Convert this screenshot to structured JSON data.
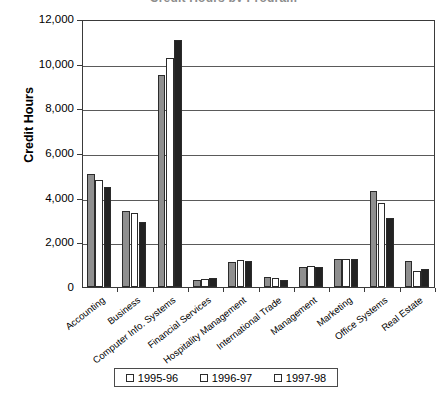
{
  "chart_data": {
    "type": "bar",
    "title": "Credit Hours by Program",
    "xlabel": "",
    "ylabel": "Credit Hours",
    "ylim": [
      0,
      12000
    ],
    "yticks": [
      "0",
      "2,000",
      "4,000",
      "6,000",
      "8,000",
      "10,000",
      "12,000"
    ],
    "ytick_values": [
      0,
      2000,
      4000,
      6000,
      8000,
      10000,
      12000
    ],
    "grid": true,
    "legend_position": "bottom",
    "categories": [
      "Accounting",
      "Business",
      "Computer Info. Systems",
      "Financial Services",
      "Hospitality Management",
      "International Trade",
      "Management",
      "Marketing",
      "Office Systems",
      "Real Estate"
    ],
    "series": [
      {
        "name": "1995-96",
        "color": "#8f8f8f",
        "values": [
          5050,
          3400,
          9500,
          300,
          1100,
          450,
          900,
          1250,
          4300,
          1150
        ]
      },
      {
        "name": "1996-97",
        "color": "#ffffff",
        "values": [
          4800,
          3300,
          10250,
          350,
          1200,
          400,
          950,
          1250,
          3750,
          700
        ]
      },
      {
        "name": "1997-98",
        "color": "#222222",
        "values": [
          4500,
          2900,
          11050,
          400,
          1150,
          300,
          900,
          1250,
          3100,
          800
        ]
      }
    ]
  },
  "legend": {
    "items": [
      {
        "label": "1995-96"
      },
      {
        "label": "1996-97"
      },
      {
        "label": "1997-98"
      }
    ]
  }
}
